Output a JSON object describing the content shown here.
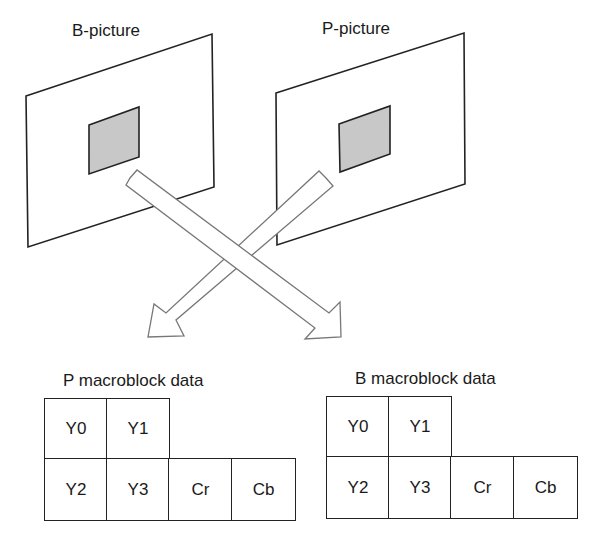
{
  "pictures": {
    "b_picture": {
      "label": "B-picture"
    },
    "p_picture": {
      "label": "P-picture"
    }
  },
  "macroblocks": {
    "p": {
      "title": "P macroblock data",
      "cells": [
        "Y0",
        "Y1",
        "Y2",
        "Y3",
        "Cr",
        "Cb"
      ]
    },
    "b": {
      "title": "B macroblock data",
      "cells": [
        "Y0",
        "Y1",
        "Y2",
        "Y3",
        "Cr",
        "Cb"
      ]
    }
  },
  "colors": {
    "stroke": "#222222",
    "shaded_block": "#c8c8c8",
    "arrow_outline": "#777777"
  }
}
